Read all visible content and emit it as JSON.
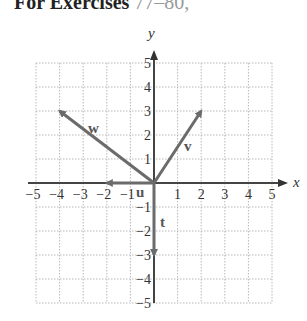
{
  "header": {
    "text_bold": "For Exercises",
    "text_faded": "77–80,"
  },
  "diagram": {
    "type": "vector-plot",
    "axes": {
      "x_label": "x",
      "y_label": "y",
      "x_ticks": [
        "−5",
        "−4",
        "−3",
        "−2",
        "−1",
        "1",
        "2",
        "3",
        "4",
        "5"
      ],
      "y_ticks": [
        "5",
        "4",
        "3",
        "2",
        "1",
        "−1",
        "−2",
        "−3",
        "−4",
        "−5"
      ],
      "range": [
        -5,
        5
      ]
    },
    "vectors": [
      {
        "name": "v",
        "from": [
          0,
          0
        ],
        "to": [
          2,
          3
        ]
      },
      {
        "name": "w",
        "from": [
          0,
          0
        ],
        "to": [
          -4,
          3
        ]
      },
      {
        "name": "u",
        "from": [
          0,
          0
        ],
        "to": [
          -2,
          0
        ]
      },
      {
        "name": "t",
        "from": [
          0,
          0
        ],
        "to": [
          0,
          -3
        ]
      }
    ],
    "colors": {
      "vector": "#6b6b6b",
      "axis": "#444444",
      "grid": "#b0b0b0"
    }
  }
}
